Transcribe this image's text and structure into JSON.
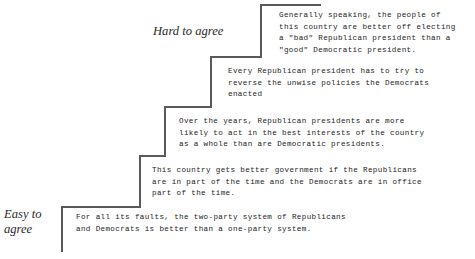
{
  "figure": {
    "type": "guttman-scale-staircase",
    "background_color": "#ffffff",
    "line_color": "#5a5a5a",
    "text_color": "#1c1c1c"
  },
  "anchors": {
    "top_label": "Hard to agree",
    "bottom_label": "Easy to\nagree"
  },
  "caption": {
    "text": ""
  },
  "items": [
    {
      "rank": 1,
      "difficulty": "hardest",
      "text": "Generally speaking, the people of\nthis country are better off electing\na \"bad\" Republican president than a\n\"good\" Democratic president."
    },
    {
      "rank": 2,
      "difficulty": "hard",
      "text": "Every Republican president has to try to\nreverse the unwise policies the Democrats\nenacted"
    },
    {
      "rank": 3,
      "difficulty": "medium",
      "text": "Over the years, Republican presidents are more\nlikely to act in the best interests of the country\nas a whole than are Democratic presidents."
    },
    {
      "rank": 4,
      "difficulty": "easy",
      "text": "This country gets better government if the Republicans\nare in part of the time and the Democrats are in office\npart of the time."
    },
    {
      "rank": 5,
      "difficulty": "easiest",
      "text": "For all its faults, the two-party system of Republicans\nand Democrats is better than a one-party system."
    }
  ]
}
